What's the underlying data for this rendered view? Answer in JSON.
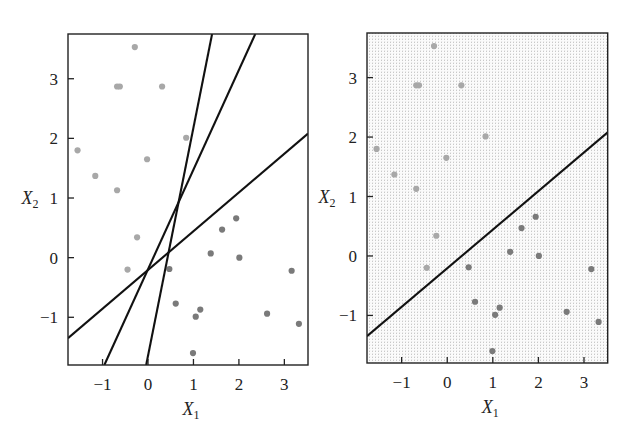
{
  "chart_data": [
    {
      "type": "scatter",
      "panel": "left",
      "title": "",
      "xlabel": "X1",
      "ylabel": "X2",
      "xlim": [
        -1.76,
        3.52
      ],
      "ylim": [
        -1.8,
        3.75
      ],
      "xticks": [
        -1,
        0,
        1,
        2,
        3
      ],
      "yticks": [
        -1,
        0,
        1,
        2,
        3
      ],
      "grid": false,
      "shaded_background": false,
      "series": [
        {
          "name": "class_light",
          "color": "#a8a8a8",
          "points": [
            [
              -0.29,
              3.53
            ],
            [
              -0.68,
              2.87
            ],
            [
              -0.62,
              2.87
            ],
            [
              0.31,
              2.87
            ],
            [
              0.84,
              2.01
            ],
            [
              -1.55,
              1.8
            ],
            [
              -0.02,
              1.65
            ],
            [
              -1.16,
              1.37
            ],
            [
              -0.68,
              1.13
            ],
            [
              -0.24,
              0.34
            ],
            [
              -0.45,
              -0.2
            ]
          ]
        },
        {
          "name": "class_dark",
          "color": "#7a7a7a",
          "points": [
            [
              1.94,
              0.66
            ],
            [
              1.63,
              0.47
            ],
            [
              1.38,
              0.07
            ],
            [
              2.01,
              0.0
            ],
            [
              0.47,
              -0.19
            ],
            [
              3.16,
              -0.22
            ],
            [
              0.61,
              -0.77
            ],
            [
              1.15,
              -0.87
            ],
            [
              1.05,
              -0.99
            ],
            [
              2.62,
              -0.94
            ],
            [
              3.32,
              -1.11
            ],
            [
              0.99,
              -1.6
            ]
          ]
        }
      ],
      "lines": [
        {
          "name": "hyperplane-steep",
          "from": [
            -0.04,
            -1.8
          ],
          "to": [
            1.41,
            3.75
          ],
          "color": "#111111"
        },
        {
          "name": "hyperplane-medium",
          "from": [
            -0.96,
            -1.8
          ],
          "to": [
            2.36,
            3.75
          ],
          "color": "#111111"
        },
        {
          "name": "hyperplane-shallow",
          "from": [
            -1.76,
            -1.35
          ],
          "to": [
            3.52,
            2.08
          ],
          "color": "#111111"
        }
      ]
    },
    {
      "type": "scatter",
      "panel": "right",
      "title": "",
      "xlabel": "X1",
      "ylabel": "X2",
      "xlim": [
        -1.76,
        3.52
      ],
      "ylim": [
        -1.8,
        3.75
      ],
      "xticks": [
        -1,
        0,
        1,
        2,
        3
      ],
      "yticks": [
        -1,
        0,
        1,
        2,
        3
      ],
      "grid": false,
      "shaded_background": true,
      "series": [
        {
          "name": "class_light",
          "color": "#a8a8a8",
          "points": [
            [
              -0.29,
              3.53
            ],
            [
              -0.68,
              2.87
            ],
            [
              -0.62,
              2.87
            ],
            [
              0.31,
              2.87
            ],
            [
              0.84,
              2.01
            ],
            [
              -1.55,
              1.8
            ],
            [
              -0.02,
              1.65
            ],
            [
              -1.16,
              1.37
            ],
            [
              -0.68,
              1.13
            ],
            [
              -0.24,
              0.34
            ],
            [
              -0.45,
              -0.2
            ]
          ]
        },
        {
          "name": "class_dark",
          "color": "#7a7a7a",
          "points": [
            [
              1.94,
              0.66
            ],
            [
              1.63,
              0.47
            ],
            [
              1.38,
              0.07
            ],
            [
              2.01,
              0.0
            ],
            [
              0.47,
              -0.19
            ],
            [
              3.16,
              -0.22
            ],
            [
              0.61,
              -0.77
            ],
            [
              1.15,
              -0.87
            ],
            [
              1.05,
              -0.99
            ],
            [
              2.62,
              -0.94
            ],
            [
              3.32,
              -1.11
            ],
            [
              0.99,
              -1.6
            ]
          ]
        }
      ],
      "lines": [
        {
          "name": "hyperplane-shallow",
          "from": [
            -1.76,
            -1.35
          ],
          "to": [
            3.52,
            2.08
          ],
          "color": "#111111"
        }
      ]
    }
  ],
  "axes": {
    "x_title": "X",
    "x_sub": "1",
    "y_title": "X",
    "y_sub": "2",
    "tick_labels": [
      "−1",
      "0",
      "1",
      "2",
      "3"
    ]
  },
  "colors": {
    "frame": "#222222",
    "line": "#111111",
    "light_points": "#a8a8a8",
    "dark_points": "#7a7a7a",
    "shade": "#c9c9c9"
  }
}
